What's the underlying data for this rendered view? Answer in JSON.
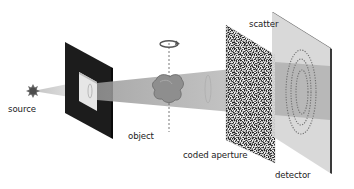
{
  "diagram": {
    "type": "coded-aperture scatter imaging schematic",
    "labels": {
      "source": "source",
      "object": "object",
      "coded_aperture": "coded aperture",
      "scatter": "scatter",
      "detector": "detector"
    },
    "components": [
      {
        "id": "source",
        "icon": "starburst-icon",
        "label": "source"
      },
      {
        "id": "collimator",
        "icon": "square-frame-aperture",
        "label": ""
      },
      {
        "id": "object",
        "icon": "rotating-object-icon",
        "label": "object",
        "rotation": "rotation-arrow-icon"
      },
      {
        "id": "coded-aperture",
        "icon": "noise-mask-panel",
        "label": "coded aperture"
      },
      {
        "id": "detector",
        "icon": "detector-panel",
        "label": "detector",
        "annotation": "scatter"
      }
    ],
    "colors": {
      "frame": "#1c1c1c",
      "beam": "#b5b5b5",
      "object": "#8a8a8a",
      "detector": "#d4d4d4",
      "detector_edge": "#3a3a3a",
      "text": "#222222"
    }
  }
}
